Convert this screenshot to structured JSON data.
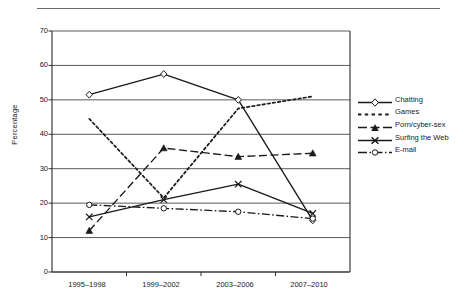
{
  "chart_data": {
    "type": "line",
    "title": "",
    "xlabel": "",
    "ylabel": "Percentage",
    "categories": [
      "1995–1998",
      "1999–2002",
      "2003–2006",
      "2007–2010"
    ],
    "ylim": [
      0,
      70
    ],
    "yticks": [
      0,
      10,
      20,
      30,
      40,
      50,
      60,
      70
    ],
    "grid": "horizontal",
    "legend_position": "right",
    "series": [
      {
        "name": "Chatting",
        "marker": "open-diamond",
        "line": "solid",
        "values": [
          51.5,
          57.5,
          50.0,
          15.0
        ]
      },
      {
        "name": "Games",
        "marker": "none",
        "line": "dotted",
        "values": [
          44.5,
          21.5,
          47.5,
          51.0
        ]
      },
      {
        "name": "Porn/cyber-sex",
        "marker": "filled-triangle",
        "line": "dashed",
        "values": [
          12.0,
          36.0,
          33.5,
          34.5
        ]
      },
      {
        "name": "Surfing the Web",
        "marker": "cross-x",
        "line": "solid",
        "values": [
          16.0,
          21.0,
          25.5,
          17.0
        ]
      },
      {
        "name": "E-mail",
        "marker": "open-circle",
        "line": "dash-dot",
        "values": [
          19.5,
          18.5,
          17.5,
          15.5
        ]
      }
    ]
  },
  "axis": {
    "ylabel": "Percentage",
    "ytick_labels": [
      "70",
      "60",
      "50",
      "40",
      "30",
      "20",
      "10",
      "0"
    ],
    "xtick_labels": [
      "1995–1998",
      "1999–2002",
      "2003–2006",
      "2007–2010"
    ]
  },
  "legend": {
    "items": [
      {
        "label": "Chatting"
      },
      {
        "label": "Games"
      },
      {
        "label": "Porn/cyber-sex"
      },
      {
        "label": "Surfing the Web"
      },
      {
        "label": "E-mail"
      }
    ]
  },
  "colors": {
    "ink": "#1a1a1a",
    "grid": "#5a5a5a",
    "axis": "#2b2b2b",
    "rule": "#6b6b6b",
    "background": "#ffffff"
  }
}
